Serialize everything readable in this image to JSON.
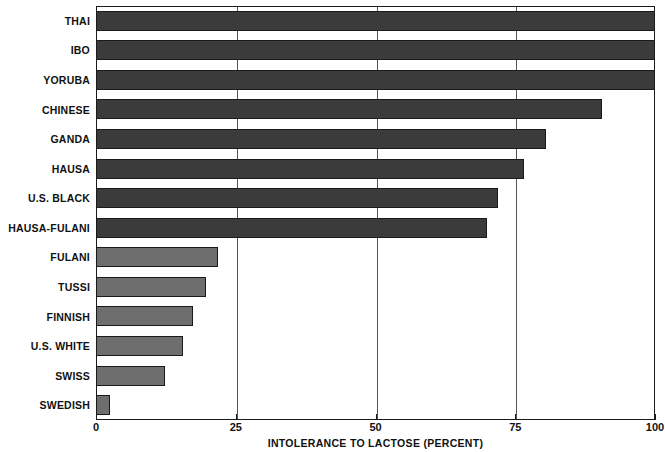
{
  "chart_data": {
    "type": "bar",
    "orientation": "horizontal",
    "title": "",
    "xlabel": "INTOLERANCE TO LACTOSE (PERCENT)",
    "ylabel": "",
    "xlim": [
      0,
      100
    ],
    "xticks": [
      0,
      25,
      50,
      75,
      100
    ],
    "xtick_labels": [
      "0",
      "25",
      "50",
      "75",
      "100"
    ],
    "grid": "vertical gridlines at 25, 50, 75",
    "legend": "none",
    "categories": [
      "THAI",
      "IBO",
      "YORUBA",
      "CHINESE",
      "GANDA",
      "HAUSA",
      "U.S. BLACK",
      "HAUSA-FULANI",
      "FULANI",
      "TUSSI",
      "FINNISH",
      "U.S. WHITE",
      "SWISS",
      "SWEDISH"
    ],
    "values": [
      100,
      100,
      100,
      90.5,
      80.5,
      76.5,
      72,
      70,
      21.8,
      19.7,
      17.4,
      15.6,
      12.3,
      2.5
    ],
    "bar_shades": [
      "dark",
      "dark",
      "dark",
      "dark",
      "dark",
      "dark",
      "dark",
      "dark",
      "light",
      "light",
      "light",
      "light",
      "light",
      "light"
    ],
    "colors": {
      "dark_bar": "#3b3b3b",
      "light_bar": "#6e6e6e",
      "bar_outline": "#1a1a1a",
      "gridline": "#555555",
      "axis": "#1a1a1a",
      "background": "#ffffff",
      "text": "#111111"
    }
  }
}
